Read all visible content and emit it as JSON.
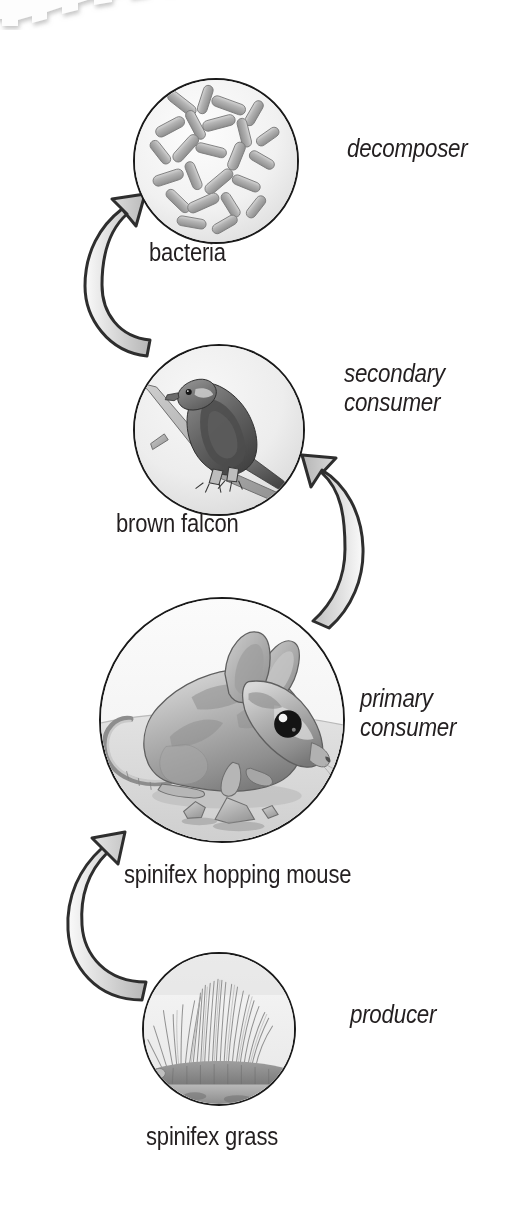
{
  "diagram": {
    "type": "cyclic-food-chain",
    "background_color": "#ffffff",
    "ink_color": "#231f20",
    "arrow_fill": "#d4d4d4",
    "arrow_stroke": "#2b2b2b",
    "disc_stroke": "#1a1a1a",
    "decoration": {
      "name": "torn-paper-edge",
      "position": "top-left"
    }
  },
  "nodes": [
    {
      "id": "bacteria",
      "species": "bacteria",
      "role": "decomposer",
      "illustration": "rod-shaped-bacteria",
      "trophic_level": 4,
      "disc": {
        "cx": 216,
        "cy": 161,
        "r": 83
      }
    },
    {
      "id": "falcon",
      "species": "brown falcon",
      "role": "secondary\nconsumer",
      "role_line1": "secondary",
      "role_line2": "consumer",
      "illustration": "falcon-perched-on-branch",
      "trophic_level": 3,
      "disc": {
        "cx": 219,
        "cy": 430,
        "r": 86
      }
    },
    {
      "id": "mouse",
      "species": "spinifex hopping mouse",
      "role": "primary\nconsumer",
      "role_line1": "primary",
      "role_line2": "consumer",
      "illustration": "hopping-mouse",
      "trophic_level": 2,
      "disc": {
        "cx": 222,
        "cy": 720,
        "r": 123
      }
    },
    {
      "id": "grass",
      "species": "spinifex grass",
      "role": "producer",
      "illustration": "spinifex-grass-tussock",
      "trophic_level": 1,
      "disc": {
        "cx": 219,
        "cy": 1029,
        "r": 77
      }
    }
  ],
  "arrows": [
    {
      "id": "grass-to-mouse",
      "from": "grass",
      "to": "mouse",
      "side": "left",
      "direction": "up"
    },
    {
      "id": "mouse-to-falcon",
      "from": "mouse",
      "to": "falcon",
      "side": "right",
      "direction": "up"
    },
    {
      "id": "falcon-to-bacteria",
      "from": "falcon",
      "to": "bacteria",
      "side": "left",
      "direction": "up"
    }
  ]
}
